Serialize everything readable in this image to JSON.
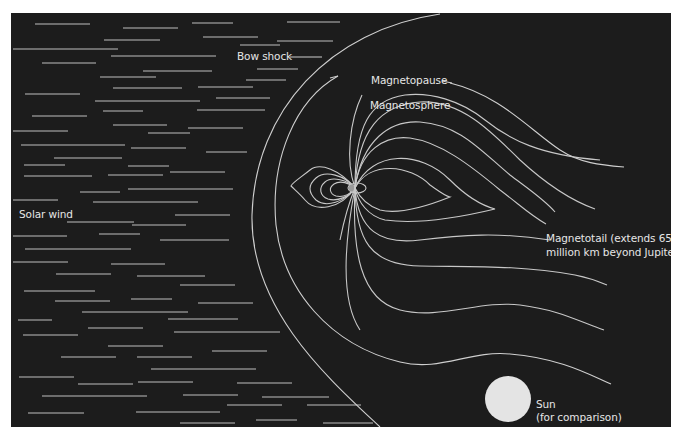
{
  "diagram": {
    "background_color": "#1c1c1c",
    "line_color": "#c8c8c8",
    "labels": {
      "bow_shock": "Bow shock",
      "magnetopause": "Magnetopause",
      "magnetosphere": "Magnetosphere",
      "solar_wind": "Solar wind",
      "magnetotail_line1": "Magnetotail (extends 650",
      "magnetotail_line2": "million km beyond Jupiter)",
      "sun_line1": "Sun",
      "sun_line2": "(for comparison)"
    },
    "sun": {
      "fill": "#e4e4e4"
    }
  }
}
